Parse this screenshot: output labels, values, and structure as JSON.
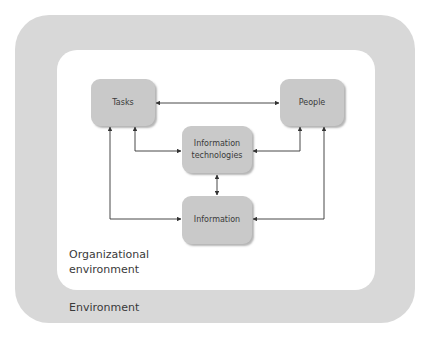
{
  "diagram": {
    "environment_label": "Environment",
    "organizational_environment_label_line1": "Organizational",
    "organizational_environment_label_line2": "environment",
    "nodes": {
      "tasks": "Tasks",
      "people": "People",
      "information_technologies": "Information\ntechnologies",
      "information": "Information"
    },
    "edges": [
      {
        "from": "Tasks",
        "to": "People",
        "direction": "bidirectional"
      },
      {
        "from": "Tasks",
        "to": "Information technologies",
        "direction": "bidirectional"
      },
      {
        "from": "People",
        "to": "Information technologies",
        "direction": "bidirectional"
      },
      {
        "from": "Information technologies",
        "to": "Information",
        "direction": "bidirectional"
      },
      {
        "from": "Tasks",
        "to": "Information",
        "direction": "bidirectional"
      },
      {
        "from": "People",
        "to": "Information",
        "direction": "bidirectional"
      }
    ],
    "colors": {
      "environment_fill": "#d8d8d8",
      "organization_fill": "#ffffff",
      "node_fill": "#c9c9c9",
      "edge_stroke": "#333333",
      "text": "#3a3a3a"
    }
  }
}
